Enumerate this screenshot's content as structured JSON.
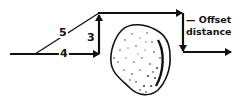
{
  "diagram": {
    "type": "offset-detour-around-obstacle",
    "stroke_color": "#111111",
    "background": "#ffffff",
    "triangle": {
      "hypotenuse_label": "5",
      "base_label": "4",
      "height_label": "3"
    },
    "offset_label": {
      "line1": "— Offset",
      "line2": "distance"
    },
    "obstacle": "rock"
  }
}
